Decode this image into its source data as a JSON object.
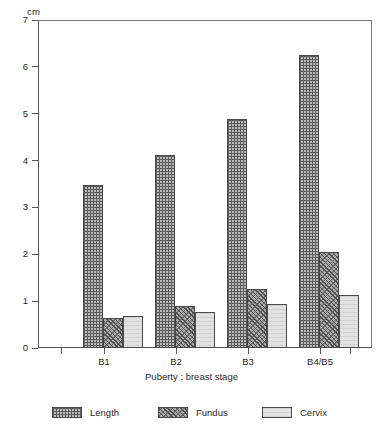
{
  "chart_data": {
    "type": "bar",
    "title": "",
    "subtitle": "",
    "xlabel": "Puberty : breast stage",
    "ylabel": "cm",
    "unit_label": "cm",
    "categories": [
      "B1",
      "B2",
      "B3",
      "B4/B5"
    ],
    "series": [
      {
        "name": "Length",
        "values": [
          3.48,
          4.12,
          4.88,
          6.25
        ],
        "pattern": "cross-hatch",
        "color": "#b9b9b9"
      },
      {
        "name": "Fundus",
        "values": [
          0.65,
          0.9,
          1.25,
          2.05
        ],
        "pattern": "diagonal-hatch",
        "color": "#a9a9a9"
      },
      {
        "name": "Cervix",
        "values": [
          0.68,
          0.77,
          0.95,
          1.13
        ],
        "pattern": "light-fill",
        "color": "#e2e2e2"
      }
    ],
    "ylim": [
      0,
      7
    ],
    "ytick_values": [
      0,
      1,
      2,
      3,
      4,
      5,
      6,
      7
    ],
    "ytick_labels": [
      "0",
      "1",
      "2",
      "3",
      "4",
      "5",
      "6",
      "7"
    ],
    "grid": false,
    "legend_position": "bottom",
    "axis_color": "#555555",
    "bar_edge_color": "#4a4a4a"
  },
  "legend": {
    "items": [
      {
        "label": "Length"
      },
      {
        "label": "Fundus"
      },
      {
        "label": "Cervix"
      }
    ]
  },
  "axes": {
    "y_unit": "cm",
    "x_title": "Puberty : breast stage"
  }
}
